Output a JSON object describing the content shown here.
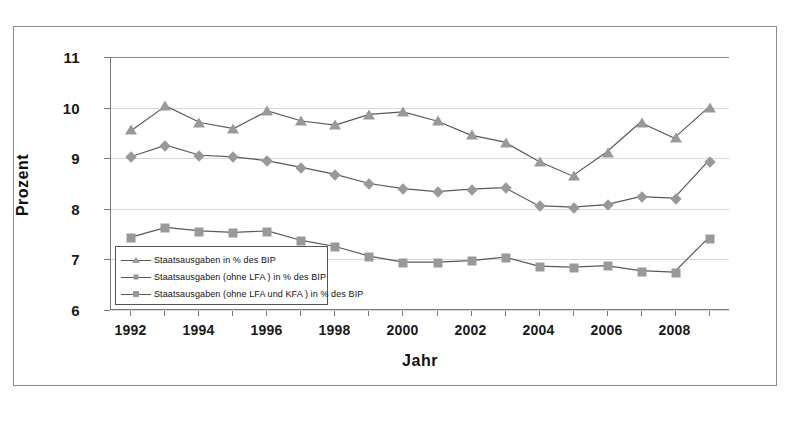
{
  "chart_data": {
    "type": "line",
    "title": "",
    "xlabel": "Jahr",
    "ylabel": "Prozent",
    "xlim": [
      1991.4,
      2009.6
    ],
    "ylim": [
      6,
      11
    ],
    "yticks": [
      6,
      7,
      8,
      9,
      10,
      11
    ],
    "ytick_labels": [
      "6",
      "7",
      "8",
      "9",
      "10",
      "11"
    ],
    "xticks": [
      1992,
      1993,
      1994,
      1995,
      1996,
      1997,
      1998,
      1999,
      2000,
      2001,
      2002,
      2003,
      2004,
      2005,
      2006,
      2007,
      2008,
      2009
    ],
    "xtick_labels_shown": [
      "1992",
      "1994",
      "1996",
      "1998",
      "2000",
      "2002",
      "2004",
      "2006",
      "2008"
    ],
    "x": [
      1992,
      1993,
      1994,
      1995,
      1996,
      1997,
      1998,
      1999,
      2000,
      2001,
      2002,
      2003,
      2004,
      2005,
      2006,
      2007,
      2008,
      2009
    ],
    "grid": "horizontal",
    "legend_position": "lower-left-inside",
    "series": [
      {
        "name": "Staatsausgaben in % des BIP",
        "marker": "triangle",
        "color": "#999999",
        "values": [
          9.55,
          10.03,
          9.7,
          9.58,
          9.93,
          9.73,
          9.65,
          9.86,
          9.91,
          9.73,
          9.45,
          9.31,
          8.93,
          8.64,
          9.11,
          9.7,
          9.39,
          9.99
        ]
      },
      {
        "name": "Staatsausgaben (ohne LFA ) in % des BIP",
        "marker": "diamond",
        "color": "#999999",
        "values": [
          9.03,
          9.25,
          9.05,
          9.02,
          8.94,
          8.81,
          8.67,
          8.49,
          8.39,
          8.33,
          8.38,
          8.41,
          8.05,
          8.02,
          8.07,
          8.23,
          8.2,
          8.93
        ]
      },
      {
        "name": "Staatsausgaben (ohne LFA und KFA ) in % des BIP",
        "marker": "square",
        "color": "#999999",
        "values": [
          7.43,
          7.62,
          7.55,
          7.52,
          7.55,
          7.36,
          7.24,
          7.05,
          6.93,
          6.93,
          6.96,
          7.03,
          6.85,
          6.83,
          6.86,
          6.76,
          6.73,
          7.4
        ]
      }
    ],
    "legend_entries": [
      "Staatsausgaben in % des BIP",
      "Staatsausgaben (ohne LFA ) in % des BIP",
      "Staatsausgaben (ohne LFA und KFA ) in % des BIP"
    ]
  }
}
